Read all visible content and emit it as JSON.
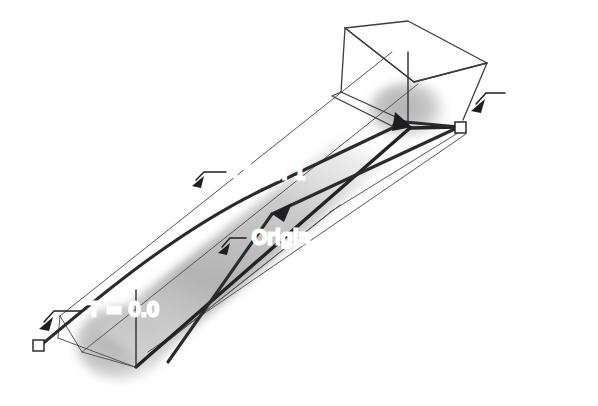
{
  "figure": {
    "background_color": "#ffffff",
    "width": 598,
    "height": 406
  },
  "labels": {
    "chain": "Chain 1",
    "origin": "Origin",
    "t_upper_right": "T = 0.0",
    "t_lower_left": "T = 0.0"
  },
  "colors": {
    "ink": "#1f1f22",
    "heavy_stroke": "#232326",
    "thin_edge": "#56565a",
    "frame_edge": "#3c3c40",
    "cylinder_gray_light": "#d9d9d9",
    "cylinder_gray_mid": "#b9b9b9",
    "cylinder_gray_dark": "#a8a8a8",
    "marker_fill": "#ffffff"
  },
  "elements": {
    "cylinder_name": "shaded-cylinder",
    "axis_name": "origin-axis-line",
    "chain_name": "chain-1-polyline",
    "plane_name": "cross-section-plane",
    "marker_upper_right": "endpoint-square-upper-right",
    "marker_lower_left": "endpoint-square-lower-left",
    "bounding_box_name": "wireframe-bounding-box"
  },
  "annotations": [
    {
      "id": "chain-1",
      "text": "Chain 1",
      "text_x": 232,
      "text_y": 173,
      "leader": "M 196,180 L 204,172 L 226,172"
    },
    {
      "id": "origin",
      "text": "Origin",
      "text_x": 252,
      "text_y": 238,
      "leader": "M 222,247 L 230,238 L 246,238"
    },
    {
      "id": "t-upper-right",
      "text": "T = 0.0",
      "text_x": 511,
      "text_y": 90,
      "leader": "M 476,104 L 486,93 L 505,93"
    },
    {
      "id": "t-lower-left",
      "text": "T = 0.0",
      "text_x": 88,
      "text_y": 308,
      "leader": "M 44,322 L 54,311 L 82,311"
    }
  ]
}
